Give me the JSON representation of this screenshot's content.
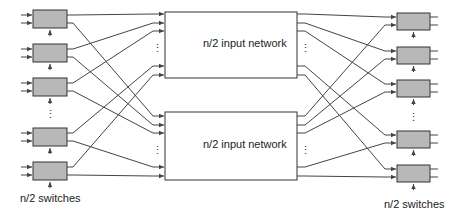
{
  "diagram": {
    "left_switches_label": "n/2 switches",
    "right_switches_label": "n/2 switches",
    "networks": [
      {
        "label": "n/2 input network",
        "x": 165,
        "y": 12,
        "w": 132,
        "h": 66
      },
      {
        "label": "n/2 input network",
        "x": 165,
        "y": 112,
        "w": 132,
        "h": 68
      }
    ],
    "left_switches": [
      {
        "x": 33,
        "y": 10,
        "w": 34,
        "h": 18
      },
      {
        "x": 33,
        "y": 44,
        "w": 34,
        "h": 18
      },
      {
        "x": 33,
        "y": 78,
        "w": 34,
        "h": 18
      },
      {
        "x": 33,
        "y": 128,
        "w": 34,
        "h": 18
      },
      {
        "x": 33,
        "y": 162,
        "w": 34,
        "h": 18
      }
    ],
    "right_switches": [
      {
        "x": 397,
        "y": 13,
        "w": 33,
        "h": 17
      },
      {
        "x": 397,
        "y": 47,
        "w": 33,
        "h": 17
      },
      {
        "x": 397,
        "y": 80,
        "w": 33,
        "h": 17
      },
      {
        "x": 397,
        "y": 131,
        "w": 33,
        "h": 17
      },
      {
        "x": 397,
        "y": 165,
        "w": 33,
        "h": 17
      }
    ],
    "top_net_ports": [
      14,
      23,
      31,
      66,
      75
    ],
    "bottom_net_ports": [
      116,
      125,
      133,
      167,
      176
    ],
    "colors": {
      "switch_fill": "#b8b8b8",
      "stroke": "#333333",
      "line": "#444444"
    },
    "ellipsis": "⋮"
  }
}
